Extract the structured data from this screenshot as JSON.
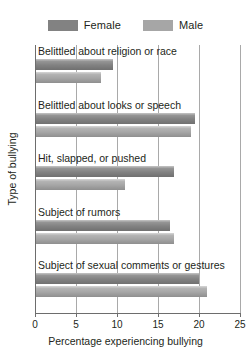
{
  "chart_data": {
    "type": "bar",
    "orientation": "horizontal",
    "title": "",
    "xlabel": "Percentage experiencing bullying",
    "ylabel": "Type of bullying",
    "xlim": [
      0,
      25
    ],
    "xticks": [
      0,
      5,
      10,
      15,
      20,
      25
    ],
    "xtick_labels": [
      "0",
      "5",
      "10",
      "15",
      "20",
      "25"
    ],
    "grid": true,
    "grid_axis": "x",
    "legend_position": "top-center",
    "categories": [
      "Belittled about religion or race",
      "Belittled about looks or speech",
      "Hit, slapped, or pushed",
      "Subject of rumors",
      "Subject of sexual comments or gestures"
    ],
    "series": [
      {
        "name": "Female",
        "color": "#828282",
        "values": [
          9.5,
          19.5,
          17.0,
          16.5,
          20.0
        ]
      },
      {
        "name": "Male",
        "color": "#a6a6a6",
        "values": [
          8.0,
          19.0,
          11.0,
          17.0,
          21.0
        ]
      }
    ]
  },
  "legend": {
    "items": [
      {
        "label": "Female",
        "color": "#828282"
      },
      {
        "label": "Male",
        "color": "#a6a6a6"
      }
    ]
  },
  "axis": {
    "x_label": "Percentage experiencing bullying",
    "y_label": "Type of bullying",
    "x_tick_labels": [
      "0",
      "5",
      "10",
      "15",
      "20",
      "25"
    ]
  }
}
